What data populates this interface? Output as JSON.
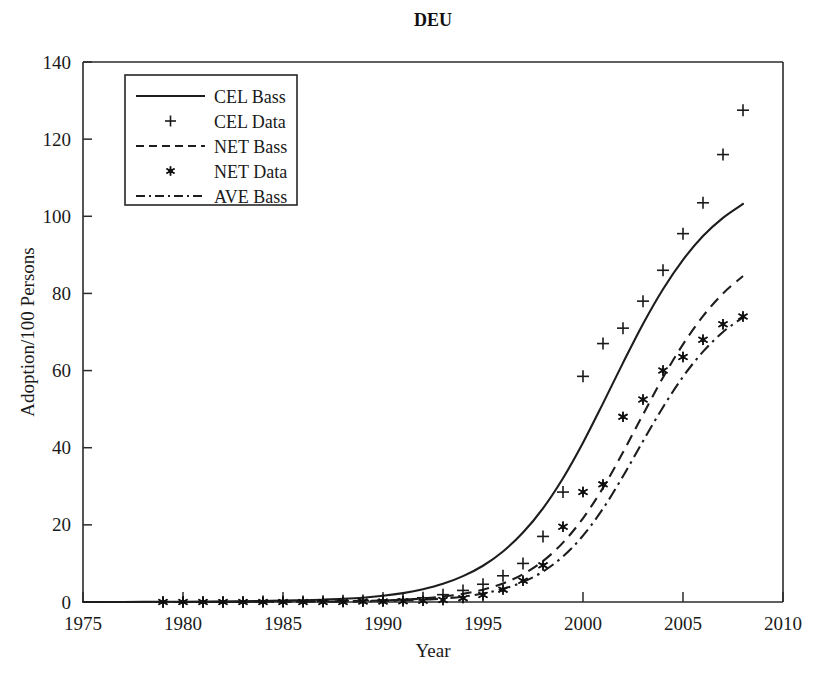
{
  "chart_data": {
    "type": "line",
    "title": "DEU",
    "xlabel": "Year",
    "ylabel": "Adoption/100 Persons",
    "xlim": [
      1975,
      2010
    ],
    "ylim": [
      0,
      140
    ],
    "xticks": [
      1975,
      1980,
      1985,
      1990,
      1995,
      2000,
      2005,
      2010
    ],
    "yticks": [
      0,
      20,
      40,
      60,
      80,
      100,
      120,
      140
    ],
    "grid": false,
    "legend_position": "upper-left-inside",
    "legend": [
      {
        "label": "CEL Bass",
        "style": "solid-line"
      },
      {
        "label": "CEL Data",
        "style": "plus-marker"
      },
      {
        "label": "NET Bass",
        "style": "dashed-line"
      },
      {
        "label": "NET Data",
        "style": "star-marker"
      },
      {
        "label": "AVE Bass",
        "style": "dashdot-line"
      }
    ],
    "series": [
      {
        "name": "CEL Bass",
        "style": "solid-line",
        "x": [
          1975,
          1977,
          1979,
          1981,
          1983,
          1985,
          1986,
          1987,
          1988,
          1989,
          1990,
          1991,
          1992,
          1993,
          1994,
          1995,
          1996,
          1997,
          1998,
          1999,
          2000,
          2001,
          2002,
          2003,
          2004,
          2005,
          2006,
          2007,
          2008
        ],
        "values": [
          0.0,
          0.0,
          0.05,
          0.1,
          0.2,
          0.35,
          0.45,
          0.6,
          0.8,
          1.1,
          1.6,
          2.3,
          3.3,
          4.7,
          6.7,
          9.4,
          13.1,
          18.0,
          24.3,
          32.1,
          41.3,
          51.5,
          62.0,
          72.1,
          81.1,
          88.7,
          94.9,
          99.6,
          103.2
        ]
      },
      {
        "name": "CEL Data",
        "style": "plus-marker",
        "x": [
          1979,
          1980,
          1981,
          1982,
          1983,
          1984,
          1985,
          1986,
          1987,
          1988,
          1989,
          1990,
          1991,
          1992,
          1993,
          1994,
          1995,
          1996,
          1997,
          1998,
          1999,
          2000,
          2001,
          2002,
          2003,
          2004,
          2005,
          2006,
          2007,
          2008
        ],
        "values": [
          0.0,
          0.0,
          0.0,
          0.0,
          0.0,
          0.1,
          0.1,
          0.1,
          0.2,
          0.3,
          0.4,
          0.5,
          0.7,
          1.1,
          1.9,
          3.0,
          4.6,
          6.8,
          10.0,
          17.0,
          28.5,
          58.5,
          67.0,
          71.0,
          78.0,
          86.0,
          95.5,
          103.5,
          116.0,
          127.5
        ]
      },
      {
        "name": "NET Bass",
        "style": "dashed-line",
        "x": [
          1975,
          1980,
          1985,
          1988,
          1990,
          1991,
          1992,
          1993,
          1994,
          1995,
          1996,
          1997,
          1998,
          1999,
          2000,
          2001,
          2002,
          2003,
          2004,
          2005,
          2006,
          2007,
          2008
        ],
        "values": [
          0.0,
          0.0,
          0.1,
          0.2,
          0.4,
          0.6,
          0.9,
          1.4,
          2.1,
          3.2,
          4.8,
          7.2,
          10.6,
          15.4,
          21.7,
          29.6,
          38.8,
          48.6,
          58.2,
          66.8,
          74.1,
          80.0,
          84.5
        ]
      },
      {
        "name": "NET Data",
        "style": "star-marker",
        "x": [
          1979,
          1980,
          1981,
          1982,
          1983,
          1984,
          1985,
          1986,
          1987,
          1988,
          1989,
          1990,
          1991,
          1992,
          1993,
          1994,
          1995,
          1996,
          1997,
          1998,
          1999,
          2000,
          2001,
          2002,
          2003,
          2004,
          2005,
          2006,
          2007,
          2008
        ],
        "values": [
          0.0,
          0.0,
          0.0,
          0.0,
          0.0,
          0.0,
          0.0,
          0.0,
          0.0,
          0.0,
          0.1,
          0.1,
          0.2,
          0.3,
          0.5,
          1.0,
          1.8,
          3.2,
          5.5,
          9.5,
          19.5,
          28.5,
          30.5,
          48.0,
          52.5,
          60.0,
          63.5,
          68.0,
          72.0,
          74.0
        ]
      },
      {
        "name": "AVE Bass",
        "style": "dashdot-line",
        "x": [
          1975,
          1980,
          1985,
          1988,
          1990,
          1991,
          1992,
          1993,
          1994,
          1995,
          1996,
          1997,
          1998,
          1999,
          2000,
          2001,
          2002,
          2003,
          2004,
          2005,
          2006,
          2007,
          2008
        ],
        "values": [
          0.0,
          0.0,
          0.05,
          0.1,
          0.25,
          0.4,
          0.6,
          0.9,
          1.4,
          2.2,
          3.4,
          5.2,
          7.9,
          11.8,
          17.2,
          24.2,
          32.6,
          41.7,
          50.5,
          58.4,
          64.9,
          70.0,
          73.8
        ]
      }
    ]
  }
}
